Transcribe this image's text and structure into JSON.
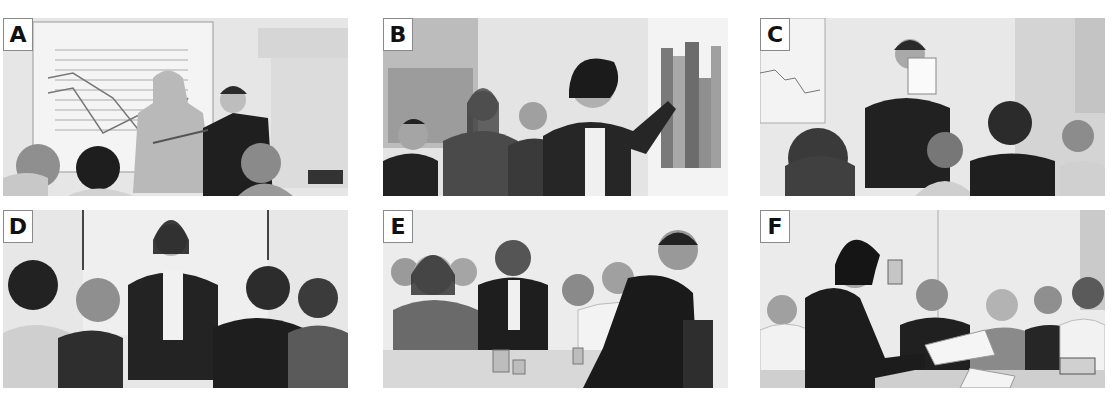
{
  "panels": [
    {
      "id": "A",
      "label": "A",
      "scene": "Man with pointer presenting a line chart on a wall screen to three seated listeners; projector on the right"
    },
    {
      "id": "B",
      "label": "B",
      "scene": "Woman pointing at a bar chart while three colleagues listen near a window"
    },
    {
      "id": "C",
      "label": "C",
      "scene": "Man holding a sheet of paper up to his face in front of an audience of four"
    },
    {
      "id": "D",
      "label": "D",
      "scene": "Woman standing with hands in pockets talking to four listeners"
    },
    {
      "id": "E",
      "label": "E",
      "scene": "Man seated facing a panel of six people at a table with water jugs"
    },
    {
      "id": "F",
      "label": "F",
      "scene": "Woman holding up a product and handing a document to five people seated at a table"
    }
  ],
  "colors": {
    "background": "#ffffff",
    "panel_bg": "#e9e9e9",
    "label_border": "#8a8a8a",
    "ink": "#111111"
  }
}
